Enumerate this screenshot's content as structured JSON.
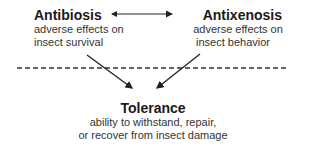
{
  "nodes": {
    "antibiosis": {
      "title": "Antibiosis",
      "line1": "adverse effects on",
      "line2": "insect survival"
    },
    "antixenosis": {
      "title": "Antixenosis",
      "line1": "adverse effects on",
      "line2": "insect behavior"
    },
    "tolerance": {
      "title": "Tolerance",
      "line1": "ability to withstand, repair,",
      "line2": "or recover from insect damage"
    }
  },
  "edges": [
    {
      "from": "antibiosis",
      "to": "antixenosis",
      "type": "bidirectional"
    },
    {
      "from": "antibiosis",
      "to": "tolerance",
      "type": "arrow"
    },
    {
      "from": "antixenosis",
      "to": "tolerance",
      "type": "arrow"
    }
  ],
  "separator": {
    "style": "dashed"
  }
}
